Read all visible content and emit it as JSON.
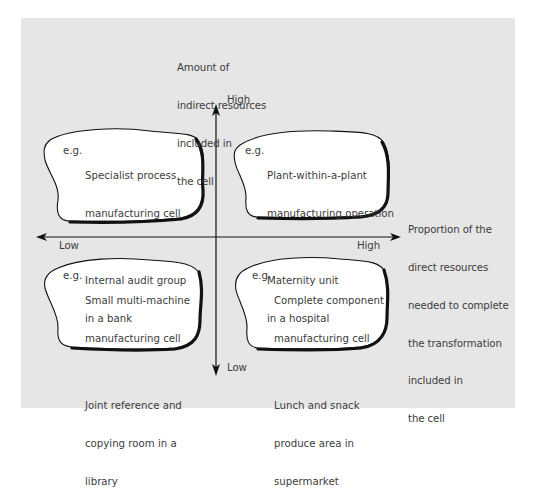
{
  "diagram": {
    "y_axis": {
      "label_lines": [
        "Amount of",
        "indirect resources",
        "included in",
        "the cell"
      ],
      "high_label": "High",
      "low_label": "Low"
    },
    "x_axis": {
      "label_lines": [
        "Proportion of the",
        "direct resources",
        "needed to complete",
        "the transformation",
        "included in",
        "the cell"
      ],
      "high_label": "High",
      "low_label": "Low"
    },
    "quadrants": {
      "top_left": {
        "prefix": "e.g.",
        "example_1": [
          "Specialist process",
          "manufacturing cell"
        ],
        "example_2": [
          "Internal audit group",
          "in a bank"
        ]
      },
      "top_right": {
        "prefix": "e.g.",
        "example_1": [
          "Plant-within-a-plant",
          "manufacturing operation"
        ],
        "example_2": [
          "Maternity unit",
          "in a hospital"
        ]
      },
      "bottom_left": {
        "prefix": "e.g.",
        "example_1": [
          "Small multi-machine",
          "manufacturing cell"
        ],
        "example_2": [
          "Joint reference and",
          "copying room in a",
          "library"
        ]
      },
      "bottom_right": {
        "prefix": "e.g.",
        "example_1": [
          "Complete component",
          "manufacturing cell"
        ],
        "example_2": [
          "Lunch and snack",
          "produce area in",
          "supermarket"
        ]
      }
    },
    "colors": {
      "background": "#e6e6e6",
      "cloud_fill": "#ffffff",
      "outline": "#111111",
      "text": "#3c3c3c"
    }
  }
}
